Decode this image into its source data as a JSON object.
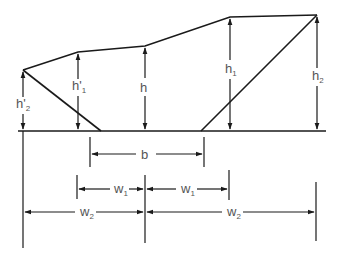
{
  "diagram": {
    "type": "cross-section dimension diagram",
    "labels": {
      "h2_prime": {
        "base": "h'",
        "sub": "2"
      },
      "h1_prime": {
        "base": "h'",
        "sub": "1"
      },
      "h": {
        "base": "h",
        "sub": ""
      },
      "h1": {
        "base": "h",
        "sub": "1"
      },
      "h2": {
        "base": "h",
        "sub": "2"
      },
      "b": {
        "base": "b",
        "sub": ""
      },
      "w1_left": {
        "base": "w",
        "sub": "1"
      },
      "w1_right": {
        "base": "w",
        "sub": "1"
      },
      "w2_left": {
        "base": "w",
        "sub": "2"
      },
      "w2_right": {
        "base": "w",
        "sub": "2"
      }
    },
    "colors": {
      "line": "#1a1a1a",
      "text": "#555555",
      "background": "#ffffff"
    }
  }
}
